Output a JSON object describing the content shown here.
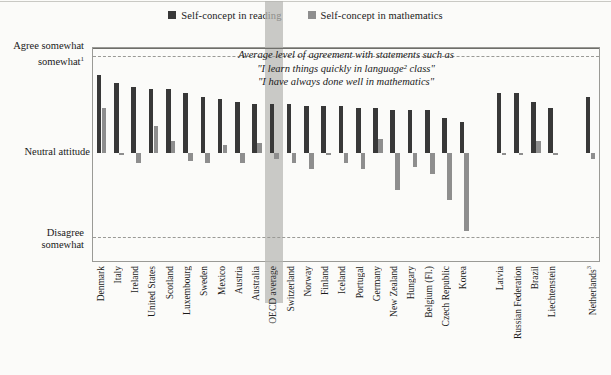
{
  "chart_data": {
    "type": "bar",
    "title": "",
    "subtitle": "",
    "annotation": [
      "Average level of agreement with statements such as",
      "\"I learn things quickly in language² class\"",
      "\"I have always done well in mathematics\""
    ],
    "legend": [
      {
        "name": "Self-concept in reading",
        "color": "#383838"
      },
      {
        "name": "Self-concept in mathematics",
        "color": "#8e8e8e"
      }
    ],
    "legend_position": "top-center",
    "xlabel": "",
    "ylabel": "",
    "grid": false,
    "ytick_labels": [
      "Agree somewhat",
      "Neutral attitude",
      "Disagree somewhat"
    ],
    "ytick_superscripts": [
      "1",
      "",
      ""
    ],
    "ytick_values": [
      0.47,
      0.0,
      -0.41
    ],
    "ylim": [
      -0.55,
      0.51
    ],
    "highlight_category": "OECD average",
    "categories": [
      "Denmark",
      "Italy",
      "Ireland",
      "United States",
      "Scotland",
      "Luxembourg",
      "Sweden",
      "Mexico",
      "Austria",
      "Australia",
      "OECD average",
      "Switzerland",
      "Norway",
      "Finland",
      "Iceland",
      "Portugal",
      "Germany",
      "New Zealand",
      "Hungary",
      "Belgium (Fl.)",
      "Czech Republic",
      "Korea",
      "Latvia",
      "Russian Federation",
      "Brazil",
      "Liechtenstein",
      "Netherlands"
    ],
    "category_superscripts": [
      "",
      "",
      "",
      "",
      "",
      "",
      "",
      "",
      "",
      "",
      "",
      "",
      "",
      "",
      "",
      "",
      "",
      "",
      "",
      "",
      "",
      "",
      "",
      "",
      "",
      "",
      "3"
    ],
    "group_breaks_after": [
      "Korea",
      "Liechtenstein"
    ],
    "series": [
      {
        "name": "Self-concept in reading",
        "color": "#383838",
        "values": [
          0.38,
          0.34,
          0.32,
          0.31,
          0.31,
          0.29,
          0.27,
          0.26,
          0.25,
          0.24,
          0.24,
          0.24,
          0.23,
          0.23,
          0.23,
          0.22,
          0.22,
          0.21,
          0.21,
          0.21,
          0.17,
          0.15,
          0.29,
          0.29,
          0.25,
          0.22,
          0.27
        ]
      },
      {
        "name": "Self-concept in mathematics",
        "color": "#8e8e8e",
        "values": [
          0.22,
          -0.01,
          -0.05,
          0.13,
          0.06,
          -0.04,
          -0.05,
          0.04,
          -0.05,
          0.05,
          -0.03,
          -0.05,
          -0.08,
          -0.01,
          -0.05,
          -0.08,
          0.07,
          -0.18,
          -0.07,
          -0.1,
          -0.23,
          -0.38,
          -0.01,
          -0.01,
          0.06,
          -0.01,
          -0.03
        ]
      }
    ]
  }
}
